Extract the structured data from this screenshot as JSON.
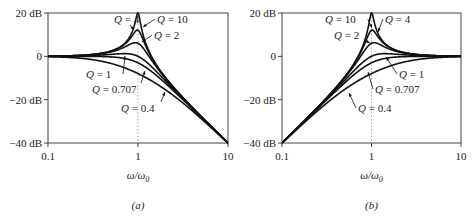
{
  "chart_data": [
    {
      "id": "a",
      "type": "line",
      "title": "",
      "caption": "(a)",
      "subtype": "second-order low-pass magnitude response",
      "xlabel": "ω/ω0",
      "ylabel": "",
      "xscale": "log",
      "xlim": [
        0.1,
        10
      ],
      "ylim": [
        -40,
        20
      ],
      "xticks": [
        "0.1",
        "1",
        "10"
      ],
      "yticks": [
        "20 dB",
        "0",
        "−20 dB",
        "−40 dB"
      ],
      "grid": false,
      "reference_line": {
        "x": 1,
        "style": "dotted"
      },
      "series": [
        {
          "name": "Q = 10",
          "Q": 10,
          "x": [
            0.1,
            0.5,
            0.8,
            1,
            1.25,
            2,
            10
          ],
          "y": [
            0.1,
            2.5,
            8.5,
            20,
            7.0,
            -9.6,
            -40
          ]
        },
        {
          "name": "Q = 4",
          "Q": 4,
          "x": [
            0.1,
            0.5,
            0.8,
            1,
            1.25,
            2,
            10
          ],
          "y": [
            0.1,
            2.4,
            7.0,
            12.0,
            5.5,
            -9.8,
            -40
          ]
        },
        {
          "name": "Q = 2",
          "Q": 2,
          "x": [
            0.1,
            0.5,
            0.8,
            1,
            1.25,
            2,
            10
          ],
          "y": [
            0.0,
            2.1,
            4.3,
            6.0,
            2.9,
            -10.3,
            -40
          ]
        },
        {
          "name": "Q = 1",
          "Q": 1,
          "x": [
            0.1,
            0.5,
            0.8,
            1,
            1.25,
            2,
            10
          ],
          "y": [
            0.0,
            1.1,
            1.2,
            0.0,
            -1.7,
            -12.3,
            -40
          ]
        },
        {
          "name": "Q = 0.707",
          "Q": 0.707,
          "x": [
            0.1,
            0.5,
            0.8,
            1,
            1.25,
            2,
            10
          ],
          "y": [
            0.0,
            -0.3,
            -1.5,
            -3.0,
            -5.0,
            -12.3,
            -40
          ]
        },
        {
          "name": "Q = 0.4",
          "Q": 0.4,
          "x": [
            0.1,
            0.5,
            0.8,
            1,
            1.25,
            2,
            10
          ],
          "y": [
            -0.3,
            -3.3,
            -5.7,
            -8.0,
            -10.3,
            -16.6,
            -40.1
          ]
        }
      ],
      "annotations": [
        "Q = 4",
        "Q = 10",
        "Q = 2",
        "Q = 1",
        "Q = 0.707",
        "Q = 0.4"
      ]
    },
    {
      "id": "b",
      "type": "line",
      "title": "",
      "caption": "(b)",
      "subtype": "second-order high-pass magnitude response",
      "xlabel": "ω/ω0",
      "ylabel": "",
      "xscale": "log",
      "xlim": [
        0.1,
        10
      ],
      "ylim": [
        -40,
        20
      ],
      "xticks": [
        "0.1",
        "1",
        "10"
      ],
      "yticks": [
        "20 dB",
        "0",
        "−20 dB",
        "−40 dB"
      ],
      "grid": false,
      "reference_line": {
        "x": 1,
        "style": "dotted"
      },
      "series": [
        {
          "name": "Q = 10",
          "Q": 10,
          "x": [
            0.1,
            0.5,
            0.8,
            1,
            1.25,
            2,
            10
          ],
          "y": [
            -40,
            -9.6,
            7.0,
            20,
            8.5,
            2.5,
            0.1
          ]
        },
        {
          "name": "Q = 4",
          "Q": 4,
          "x": [
            0.1,
            0.5,
            0.8,
            1,
            1.25,
            2,
            10
          ],
          "y": [
            -40,
            -9.8,
            5.5,
            12.0,
            7.0,
            2.4,
            0.1
          ]
        },
        {
          "name": "Q = 2",
          "Q": 2,
          "x": [
            0.1,
            0.5,
            0.8,
            1,
            1.25,
            2,
            10
          ],
          "y": [
            -40,
            -10.3,
            2.9,
            6.0,
            4.3,
            2.1,
            0.0
          ]
        },
        {
          "name": "Q = 1",
          "Q": 1,
          "x": [
            0.1,
            0.5,
            0.8,
            1,
            1.25,
            2,
            10
          ],
          "y": [
            -40,
            -12.3,
            -1.7,
            0.0,
            1.2,
            1.1,
            0.0
          ]
        },
        {
          "name": "Q = 0.707",
          "Q": 0.707,
          "x": [
            0.1,
            0.5,
            0.8,
            1,
            1.25,
            2,
            10
          ],
          "y": [
            -40,
            -12.3,
            -5.0,
            -3.0,
            -1.5,
            -0.3,
            0.0
          ]
        },
        {
          "name": "Q = 0.4",
          "Q": 0.4,
          "x": [
            0.1,
            0.5,
            0.8,
            1,
            1.25,
            2,
            10
          ],
          "y": [
            -40.1,
            -16.6,
            -10.3,
            -8.0,
            -5.7,
            -3.3,
            -0.3
          ]
        }
      ],
      "annotations": [
        "Q = 10",
        "Q = 4",
        "Q = 2",
        "Q = 1",
        "Q = 0.707",
        "Q = 0.4"
      ]
    }
  ],
  "panels": [
    {
      "kind": "lowpass",
      "box": {
        "x0": 48,
        "x1": 228,
        "y0": 13,
        "y1": 143
      },
      "caption": "(a)",
      "xlabel_main": "ω/ω",
      "xlabel_sub": "0",
      "labels": [
        {
          "q": "4",
          "text_x": 114,
          "text_y": 23,
          "tip_x": 134,
          "tip_y": 30
        },
        {
          "q": "10",
          "text_x": 157,
          "text_y": 23,
          "tip_x": 143,
          "tip_y": 27
        },
        {
          "q": "2",
          "text_x": 154,
          "text_y": 39,
          "tip_x": 142,
          "tip_y": 42
        },
        {
          "q": "1",
          "text_x": 86,
          "text_y": 78,
          "tip_x": 125,
          "tip_y": 56
        },
        {
          "q": "0.707",
          "text_x": 92,
          "text_y": 93,
          "tip_x": 145,
          "tip_y": 71
        },
        {
          "q": "0.4",
          "text_x": 121,
          "text_y": 112,
          "tip_x": 165,
          "tip_y": 92
        }
      ]
    },
    {
      "kind": "highpass",
      "box": {
        "x0": 282,
        "x1": 461,
        "y0": 13,
        "y1": 143
      },
      "caption": "(b)",
      "xlabel_main": "ω/ω",
      "xlabel_sub": "0",
      "labels": [
        {
          "q": "10",
          "text_x": 325,
          "text_y": 23,
          "tip_x": 372,
          "tip_y": 28
        },
        {
          "q": "4",
          "text_x": 385,
          "text_y": 23,
          "tip_x": 378,
          "tip_y": 32
        },
        {
          "q": "2",
          "text_x": 334,
          "text_y": 39,
          "tip_x": 370,
          "tip_y": 43
        },
        {
          "q": "1",
          "text_x": 399,
          "text_y": 78,
          "tip_x": 386,
          "tip_y": 57
        },
        {
          "q": "0.707",
          "text_x": 375,
          "text_y": 93,
          "tip_x": 368,
          "tip_y": 72
        },
        {
          "q": "0.4",
          "text_x": 358,
          "text_y": 112,
          "tip_x": 349,
          "tip_y": 93
        }
      ]
    }
  ],
  "q_values": [
    10,
    4,
    2,
    1,
    0.707,
    0.4
  ],
  "colors": {
    "curve": "#111111",
    "axis": "#444444",
    "dotted": "#999999"
  }
}
